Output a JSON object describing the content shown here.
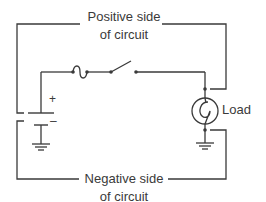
{
  "diagram": {
    "type": "electrical-circuit",
    "labels": {
      "positive_line1": "Positive side",
      "positive_line2": "of circuit",
      "negative_line1": "Negative side",
      "negative_line2": "of circuit",
      "load": "Load",
      "plus": "+",
      "minus": "–"
    },
    "components": [
      {
        "name": "battery",
        "symbol": "battery-icon"
      },
      {
        "name": "fuse",
        "symbol": "fuse-icon"
      },
      {
        "name": "switch",
        "symbol": "switch-open-icon"
      },
      {
        "name": "load",
        "symbol": "lamp-icon"
      },
      {
        "name": "ground-battery",
        "symbol": "ground-icon"
      },
      {
        "name": "ground-load",
        "symbol": "ground-icon"
      }
    ],
    "colors": {
      "line": "#3a3a3a",
      "background": "#ffffff"
    }
  }
}
